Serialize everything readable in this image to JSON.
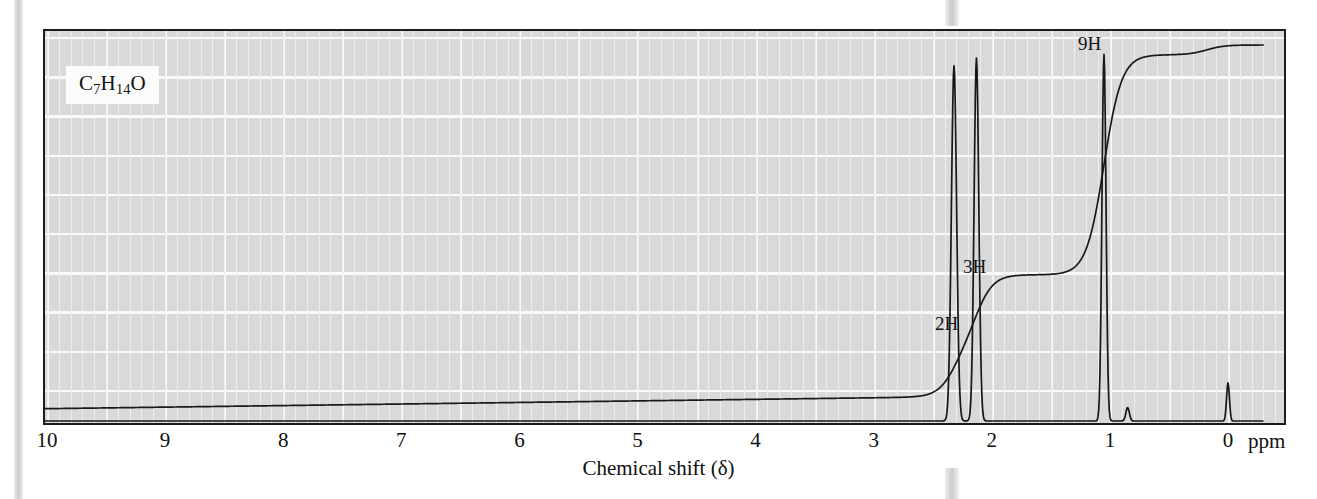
{
  "figure": {
    "formula_label": "C7H14O",
    "formula_parts": [
      {
        "text": "C",
        "sub": false
      },
      {
        "text": "7",
        "sub": true
      },
      {
        "text": "H",
        "sub": false
      },
      {
        "text": "14",
        "sub": true
      },
      {
        "text": "O",
        "sub": false
      }
    ],
    "axis_title": "Chemical shift (δ)",
    "unit_label": "ppm",
    "frame_color": "#1c1c1c",
    "plot_background": "#d9d9d9",
    "grid_color": "#f2f2f2",
    "trace_color": "#1a1a1a"
  },
  "axis": {
    "tick_labels": [
      "10",
      "9",
      "8",
      "7",
      "6",
      "5",
      "4",
      "3",
      "2",
      "1",
      "0"
    ],
    "tick_values": [
      10,
      9,
      8,
      7,
      6,
      5,
      4,
      3,
      2,
      1,
      0
    ],
    "min": 0,
    "max": 10.2,
    "direction": "reversed"
  },
  "integrations": [
    {
      "label": "9H",
      "shift": 1.05,
      "protons": 9
    },
    {
      "label": "3H",
      "shift": 2.13,
      "protons": 3
    },
    {
      "label": "2H",
      "shift": 2.32,
      "protons": 2
    }
  ],
  "chart_data": {
    "type": "line",
    "title": "",
    "xlabel": "Chemical shift (δ)",
    "ylabel": "",
    "xlim": [
      10.2,
      -0.25
    ],
    "ylim": [
      0,
      1
    ],
    "grid": true,
    "legend": "none",
    "annotations": [
      "C7H14O",
      "9H",
      "3H",
      "2H"
    ],
    "series": [
      {
        "name": "spectrum",
        "type": "peaks",
        "peaks": [
          {
            "shift": 2.32,
            "height": 0.93,
            "width": 0.022,
            "assignment": "2H quartet"
          },
          {
            "shift": 2.13,
            "height": 0.95,
            "width": 0.02,
            "assignment": "3H singlet"
          },
          {
            "shift": 1.05,
            "height": 0.96,
            "width": 0.017,
            "assignment": "9H singlet"
          },
          {
            "shift": 0.0,
            "height": 0.1,
            "width": 0.012,
            "assignment": "TMS reference"
          },
          {
            "shift": 0.85,
            "height": 0.035,
            "width": 0.015,
            "assignment": "minor"
          }
        ]
      },
      {
        "name": "integration",
        "type": "step",
        "steps": [
          {
            "shift": 2.32,
            "rise": 2
          },
          {
            "shift": 2.13,
            "rise": 3
          },
          {
            "shift": 1.05,
            "rise": 9
          },
          {
            "shift": 0.18,
            "rise": 0.4
          }
        ]
      }
    ]
  }
}
